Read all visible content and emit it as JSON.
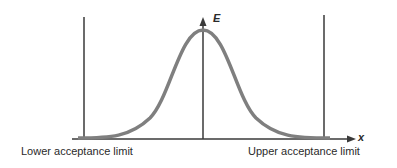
{
  "diagram": {
    "type": "normal distribution curve with acceptance limits",
    "y_axis_label": "E",
    "x_axis_label": "x",
    "lower_limit_label": "Lower acceptance limit",
    "upper_limit_label": "Upper acceptance limit",
    "colors": {
      "curve": "#7f7f7f",
      "axes": "#3a3a3a",
      "limits": "#3a3a3a"
    }
  }
}
